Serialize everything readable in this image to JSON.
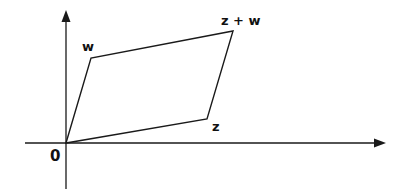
{
  "diagram": {
    "type": "parallelogram-vector-addition",
    "labels": {
      "origin": "0",
      "w": "w",
      "z": "z",
      "z_plus_w": "z + w"
    },
    "points": {
      "origin": [
        66,
        143
      ],
      "w": [
        91,
        58
      ],
      "z": [
        207,
        119
      ],
      "z_plus_w": [
        233,
        31
      ]
    },
    "axes": {
      "x_axis": {
        "from": [
          25,
          143
        ],
        "to": [
          386,
          143
        ],
        "arrow": true
      },
      "y_axis": {
        "from": [
          66,
          189
        ],
        "to": [
          66,
          10
        ],
        "arrow": true
      }
    },
    "colors": {
      "stroke": "#1a1a1a",
      "background": "#ffffff"
    }
  }
}
